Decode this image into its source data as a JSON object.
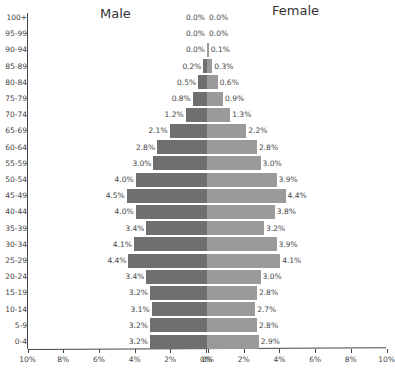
{
  "chart_data": {
    "type": "bar",
    "subtype": "population-pyramid",
    "orientation": "horizontal",
    "categories": [
      "100+",
      "95-99",
      "90-94",
      "85-89",
      "80-84",
      "75-79",
      "70-74",
      "65-69",
      "60-64",
      "55-59",
      "50-54",
      "45-49",
      "40-44",
      "35-39",
      "30-34",
      "25-29",
      "20-24",
      "15-19",
      "10-14",
      "5-9",
      "0-4"
    ],
    "series": [
      {
        "name": "Male",
        "color": "#6f6f6f",
        "side": "left",
        "values": [
          0.0,
          0.0,
          0.0,
          0.2,
          0.5,
          0.8,
          1.2,
          2.1,
          2.8,
          3.0,
          4.0,
          4.5,
          4.0,
          3.4,
          4.1,
          4.4,
          3.4,
          3.2,
          3.1,
          3.2,
          3.2
        ],
        "labels": [
          "0.0%",
          "0.0%",
          "0.0%",
          "0.2%",
          "0.5%",
          "0.8%",
          "1.2%",
          "2.1%",
          "2.8%",
          "3.0%",
          "4.0%",
          "4.5%",
          "4.0%",
          "3.4%",
          "4.1%",
          "4.4%",
          "3.4%",
          "3.2%",
          "3.1%",
          "3.2%",
          "3.2%"
        ]
      },
      {
        "name": "Female",
        "color": "#9a9a9a",
        "side": "right",
        "values": [
          0.0,
          0.0,
          0.1,
          0.3,
          0.6,
          0.9,
          1.3,
          2.2,
          2.8,
          3.0,
          3.9,
          4.4,
          3.8,
          3.2,
          3.9,
          4.1,
          3.0,
          2.8,
          2.7,
          2.8,
          2.9
        ],
        "labels": [
          "0.0%",
          "0.0%",
          "0.1%",
          "0.3%",
          "0.6%",
          "0.9%",
          "1.3%",
          "2.2%",
          "2.8%",
          "3.0%",
          "3.9%",
          "4.4%",
          "3.8%",
          "3.2%",
          "3.9%",
          "4.1%",
          "3.0%",
          "2.8%",
          "2.7%",
          "2.8%",
          "2.9%"
        ]
      }
    ],
    "titles": {
      "left": "Male",
      "right": "Female"
    },
    "xlabel": "",
    "ylabel": "",
    "xlim": [
      -10,
      10
    ],
    "x_ticks_left": [
      "10%",
      "8%",
      "6%",
      "4%",
      "2%",
      "0%"
    ],
    "x_ticks_right": [
      "0%",
      "2%",
      "4%",
      "6%",
      "8%",
      "10%"
    ],
    "grid": false,
    "legend": null
  }
}
